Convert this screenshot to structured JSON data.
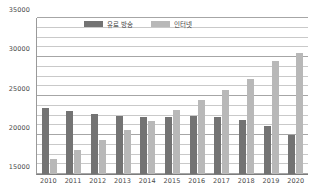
{
  "chart_data": {
    "type": "bar",
    "title": "",
    "xlabel": "",
    "ylabel": "",
    "ylim": [
      15000,
      35000
    ],
    "grid": true,
    "gridline_interval": 1250,
    "legend_position": "top-center",
    "categories": [
      "2010",
      "2011",
      "2012",
      "2013",
      "2014",
      "2015",
      "2016",
      "2017",
      "2018",
      "2019",
      "2020"
    ],
    "series": [
      {
        "name": "유료 방송",
        "color": "#737373",
        "values": [
          23500,
          23050,
          22750,
          22450,
          22300,
          22250,
          22500,
          22300,
          21950,
          21200,
          19950
        ]
      },
      {
        "name": "인터넷",
        "color": "#b8b8b8",
        "values": [
          16900,
          18100,
          19350,
          20600,
          21850,
          23200,
          24550,
          25800,
          27200,
          29500,
          30550
        ]
      }
    ],
    "y_ticks": [
      "35000",
      "30000",
      "25000",
      "20000",
      "15000"
    ],
    "y_tick_values": [
      35000,
      30000,
      25000,
      20000,
      15000
    ],
    "gridlines": [
      35000,
      33750,
      32500,
      31250,
      30000,
      28750,
      27500,
      26250,
      25000,
      23750,
      22500,
      21250,
      20000,
      18750,
      17500,
      16250,
      15000
    ]
  },
  "legend": {
    "items": [
      {
        "label": "유료 방송"
      },
      {
        "label": "인터넷"
      }
    ]
  }
}
